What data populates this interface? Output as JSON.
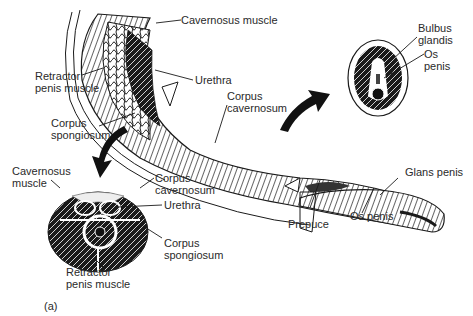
{
  "figure": {
    "panel_label": "(a)",
    "main_view": {
      "labels": {
        "cavernosus_muscle": "Cavernosus muscle",
        "retractor_line1": "Retractor",
        "retractor_line2": "penis muscle",
        "urethra": "Urethra",
        "corpus_cav_line1": "Corpus",
        "corpus_cav_line2": "cavernosum",
        "corpus_spong_line1": "Corpus",
        "corpus_spong_line2": "spongiosum",
        "glans_penis": "Glans penis",
        "prepuce": "Prepuce",
        "os_penis": "Os penis"
      }
    },
    "cross_section_proximal": {
      "labels": {
        "cavernosus_line1": "Cavernosus",
        "cavernosus_line2": "muscle",
        "corpus_cav_line1": "Corpus",
        "corpus_cav_line2": "cavernosum",
        "urethra": "Urethra",
        "corpus_spong_line1": "Corpus",
        "corpus_spong_line2": "spongiosum",
        "retractor_line1": "Retractor",
        "retractor_line2": "penis muscle"
      }
    },
    "cross_section_distal": {
      "labels": {
        "bulbus_line1": "Bulbus",
        "bulbus_line2": "glandis",
        "os_line1": "Os",
        "os_line2": "penis"
      }
    },
    "colors": {
      "ink": "#1a1a1a",
      "background": "#ffffff"
    }
  }
}
